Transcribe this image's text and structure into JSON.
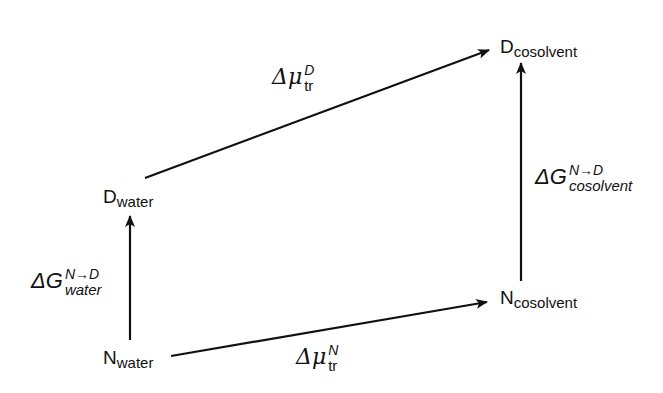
{
  "diagram": {
    "type": "thermodynamic-cycle",
    "colors": {
      "stroke": "#111111",
      "background": "#ffffff"
    },
    "states": [
      {
        "id": "N_water",
        "main": "N",
        "sub": "water"
      },
      {
        "id": "D_water",
        "main": "D",
        "sub": "water"
      },
      {
        "id": "N_cosolvent",
        "main": "N",
        "sub": "cosolvent"
      },
      {
        "id": "D_cosolvent",
        "main": "D",
        "sub": "cosolvent"
      }
    ],
    "transitions": [
      {
        "id": "dG_water",
        "from": "N_water",
        "to": "D_water",
        "symbol": "ΔG",
        "sup": "N→D",
        "sub": "water"
      },
      {
        "id": "dG_cosolvent",
        "from": "N_cosolvent",
        "to": "D_cosolvent",
        "symbol": "ΔG",
        "sup": "N→D",
        "sub": "cosolvent"
      },
      {
        "id": "dmu_N",
        "from": "N_water",
        "to": "N_cosolvent",
        "symbol": "Δμ",
        "sup": "N",
        "sub": "tr"
      },
      {
        "id": "dmu_D",
        "from": "D_water",
        "to": "D_cosolvent",
        "symbol": "Δμ",
        "sup": "D",
        "sub": "tr"
      }
    ]
  }
}
